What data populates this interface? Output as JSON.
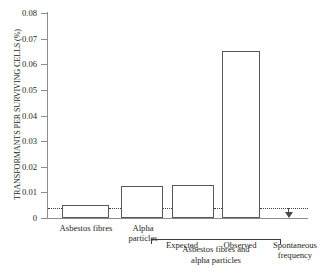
{
  "chart_data": {
    "type": "bar",
    "title": "",
    "xlabel": "",
    "ylabel": "TRANSFORMANTS PER SURVIVING CELLS (%)",
    "ylim": [
      0,
      0.08
    ],
    "yticks": [
      "0",
      "0.01",
      "0.02",
      "0.03",
      "0.04",
      "0.05",
      "0.06",
      "0.07",
      "0.08"
    ],
    "ytick_values": [
      0,
      0.01,
      0.02,
      0.03,
      0.04,
      0.05,
      0.06,
      0.07,
      0.08
    ],
    "grid": false,
    "legend": "none",
    "categories": [
      "Asbestos fibres",
      "Alpha\nparticles",
      "Expected",
      "Observed"
    ],
    "values": [
      0.005,
      0.0125,
      0.013,
      0.065
    ],
    "group_bracket": {
      "label": "Asbestos fibres and\nalpha particles",
      "spans": [
        "Expected",
        "Observed"
      ]
    },
    "annotations": [
      {
        "name": "spontaneous-frequency",
        "label": "Spontaneous\nfrequency",
        "value": 0.004,
        "style": "dotted-reference-line-with-arrow"
      }
    ],
    "colors": {
      "bar_fill": "#ffffff",
      "bar_edge": "#58585a",
      "axis": "#8c8c8c",
      "text": "#231f20",
      "dotted_line": "#3d3d3d"
    }
  }
}
